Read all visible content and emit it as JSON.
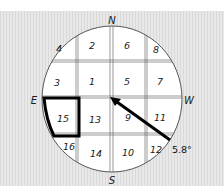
{
  "compass": {
    "north": "N",
    "south": "S",
    "east": "E",
    "west": "W"
  },
  "cells": [
    {
      "id": "4",
      "x": 59,
      "y": 52
    },
    {
      "id": "2",
      "x": 92,
      "y": 49
    },
    {
      "id": "6",
      "x": 127,
      "y": 49
    },
    {
      "id": "8",
      "x": 156,
      "y": 53
    },
    {
      "id": "3",
      "x": 57,
      "y": 86
    },
    {
      "id": "1",
      "x": 92,
      "y": 85
    },
    {
      "id": "5",
      "x": 127,
      "y": 85
    },
    {
      "id": "7",
      "x": 160,
      "y": 85
    },
    {
      "id": "15",
      "x": 63,
      "y": 122
    },
    {
      "id": "13",
      "x": 95,
      "y": 123
    },
    {
      "id": "9",
      "x": 128,
      "y": 121
    },
    {
      "id": "11",
      "x": 160,
      "y": 121
    },
    {
      "id": "16",
      "x": 69,
      "y": 150
    },
    {
      "id": "14",
      "x": 96,
      "y": 157
    },
    {
      "id": "10",
      "x": 128,
      "y": 156
    },
    {
      "id": "12",
      "x": 156,
      "y": 153
    }
  ],
  "highlighted_cell": "15",
  "arrow": {
    "angle_label": "5.8°",
    "from": [
      170,
      140
    ],
    "to": [
      111,
      98
    ]
  },
  "colors": {
    "background": "#e4e4e4",
    "circle_fill": "#ffffff",
    "lines": "#333333",
    "highlight": "#000000"
  }
}
